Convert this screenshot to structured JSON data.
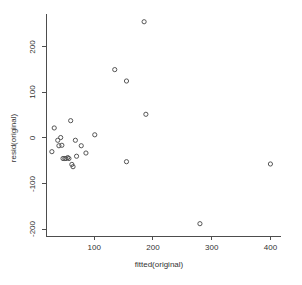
{
  "chart_data": {
    "type": "scatter",
    "title": "",
    "subtitle": "",
    "xlabel": "fitted(original)",
    "ylabel": "resid(original)",
    "xlim": [
      18,
      418
    ],
    "ylim": [
      -215,
      272
    ],
    "xticks": [
      100,
      200,
      300,
      400
    ],
    "xtick_labels": [
      "100",
      "200",
      "300",
      "400"
    ],
    "yticks": [
      -200,
      -100,
      0,
      100,
      200
    ],
    "ytick_labels": [
      "-200",
      "-100",
      "0",
      "100",
      "200"
    ],
    "grid": false,
    "legend": false,
    "legend_position": "none",
    "point_marker": "open-circle",
    "point_color": "#555555",
    "axis_color": "#4d4d4d",
    "background_color": "#ffffff",
    "series": [
      {
        "name": "residuals",
        "points": [
          [
            28,
            -30
          ],
          [
            32,
            22
          ],
          [
            38,
            -5
          ],
          [
            40,
            -17
          ],
          [
            43,
            1
          ],
          [
            45,
            -16
          ],
          [
            47,
            -45
          ],
          [
            50,
            -45
          ],
          [
            52,
            -45
          ],
          [
            55,
            -43
          ],
          [
            57,
            -45
          ],
          [
            60,
            38
          ],
          [
            62,
            -58
          ],
          [
            64,
            -63
          ],
          [
            68,
            -5
          ],
          [
            70,
            -40
          ],
          [
            78,
            -17
          ],
          [
            86,
            -33
          ],
          [
            101,
            7
          ],
          [
            135,
            150
          ],
          [
            155,
            125
          ],
          [
            155,
            -52
          ],
          [
            185,
            255
          ],
          [
            188,
            52
          ],
          [
            280,
            -188
          ],
          [
            400,
            -57
          ]
        ]
      }
    ]
  },
  "axes": {
    "x_title": "fitted(original)",
    "y_title": "resid(original)"
  }
}
